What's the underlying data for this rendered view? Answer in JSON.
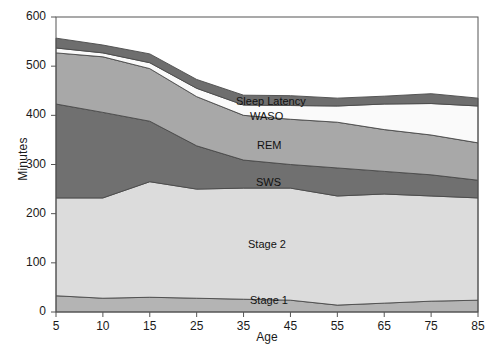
{
  "chart_data": {
    "type": "area",
    "title": "",
    "xlabel": "Age",
    "ylabel": "Minutes",
    "x": [
      5,
      10,
      15,
      25,
      35,
      45,
      55,
      65,
      75,
      85
    ],
    "xtick_labels": [
      "5",
      "10",
      "15",
      "25",
      "35",
      "45",
      "55",
      "65",
      "75",
      "85"
    ],
    "ytick_labels": [
      "0",
      "100",
      "200",
      "300",
      "400",
      "500",
      "600"
    ],
    "ylim": [
      0,
      600
    ],
    "ytick_values": [
      0,
      100,
      200,
      300,
      400,
      500,
      600
    ],
    "grid": false,
    "legend": "inline-labels",
    "stacked": true,
    "stack_order_bottom_to_top": [
      "Stage 1",
      "Stage 2",
      "SWS",
      "REM",
      "WASO",
      "Sleep Latency"
    ],
    "series": [
      {
        "name": "Stage 1",
        "color": "#b4b4b4",
        "label_text": "Stage 1",
        "values": [
          33,
          28,
          30,
          28,
          26,
          24,
          14,
          18,
          22,
          24
        ]
      },
      {
        "name": "Stage 2",
        "color": "#dcdcdc",
        "label_text": "Stage 2",
        "values": [
          199,
          204,
          235,
          222,
          226,
          228,
          222,
          222,
          214,
          208
        ]
      },
      {
        "name": "SWS",
        "color": "#707070",
        "label_text": "SWS",
        "values": [
          191,
          174,
          123,
          88,
          57,
          48,
          57,
          46,
          43,
          36
        ]
      },
      {
        "name": "REM",
        "color": "#a8a8a8",
        "label_text": "REM",
        "values": [
          104,
          113,
          107,
          100,
          91,
          92,
          93,
          85,
          81,
          76
        ]
      },
      {
        "name": "WASO",
        "color": "#fafafa",
        "label_text": "WASO",
        "values": [
          10,
          8,
          12,
          17,
          21,
          28,
          33,
          52,
          64,
          75
        ]
      },
      {
        "name": "Sleep Latency",
        "color": "#6e6e6e",
        "label_text": "Sleep Latency",
        "values": [
          20,
          16,
          18,
          18,
          20,
          20,
          16,
          16,
          20,
          16
        ]
      }
    ],
    "cumulative_top_minutes": [
      557,
      543,
      525,
      473,
      441,
      440,
      435,
      439,
      444,
      435
    ],
    "annotations": [
      {
        "text": "Sleep Latency",
        "x_px": 236,
        "y_px": 95
      },
      {
        "text": "WASO",
        "x_px": 250,
        "y_px": 110
      },
      {
        "text": "REM",
        "x_px": 257,
        "y_px": 139
      },
      {
        "text": "SWS",
        "x_px": 256,
        "y_px": 176
      },
      {
        "text": "Stage 2",
        "x_px": 248,
        "y_px": 238
      },
      {
        "text": "Stage 1",
        "x_px": 250,
        "y_px": 294
      }
    ]
  },
  "plot_geometry": {
    "left_px": 56,
    "right_px": 478,
    "top_px": 17,
    "bottom_px": 312
  }
}
